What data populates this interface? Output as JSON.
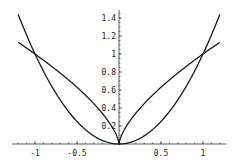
{
  "chart_data": {
    "type": "line",
    "title": "",
    "xlabel": "",
    "ylabel": "",
    "xlim": [
      -1.2,
      1.2
    ],
    "ylim": [
      0,
      1.45
    ],
    "grid": false,
    "legend": null,
    "x_ticks": [
      -1,
      -0.5,
      0.5,
      1
    ],
    "x_tick_labels": [
      "-1",
      "-0.5",
      "0.5",
      "1"
    ],
    "y_ticks": [
      0.2,
      0.4,
      0.6,
      0.8,
      1,
      1.2,
      1.4
    ],
    "y_tick_labels": [
      "0.2",
      "0.4",
      "0.6",
      "0.8",
      "1",
      "1.2",
      "1.4"
    ],
    "series": [
      {
        "name": "x^2",
        "x": [
          -1.2,
          -1.0,
          -0.8,
          -0.6,
          -0.4,
          -0.2,
          0,
          0.2,
          0.4,
          0.6,
          0.8,
          1.0,
          1.2
        ],
        "values": [
          1.44,
          1.0,
          0.64,
          0.36,
          0.16,
          0.04,
          0,
          0.04,
          0.16,
          0.36,
          0.64,
          1.0,
          1.44
        ]
      },
      {
        "name": "|x|^(2/3)",
        "x": [
          -1.2,
          -1.0,
          -0.8,
          -0.6,
          -0.4,
          -0.2,
          0,
          0.2,
          0.4,
          0.6,
          0.8,
          1.0,
          1.2
        ],
        "values": [
          1.129,
          1.0,
          0.862,
          0.711,
          0.543,
          0.342,
          0,
          0.342,
          0.543,
          0.711,
          0.862,
          1.0,
          1.129
        ]
      }
    ],
    "intersections": [
      [
        -1,
        1
      ],
      [
        0,
        0
      ],
      [
        1,
        1
      ]
    ]
  },
  "layout": {
    "origin_px": [
      119,
      144
    ],
    "x_scale_px": 84,
    "y_scale_px": 90,
    "stroke_color": "#1a1a1a",
    "axis_color": "#333333"
  }
}
